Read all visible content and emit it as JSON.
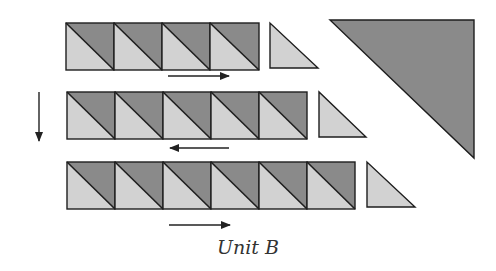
{
  "caption": "Unit B",
  "colors": {
    "dark": "#8a8a8a",
    "light": "#d2d2d2",
    "stroke": "#1e1e1e",
    "arrow": "#222222"
  },
  "rows": [
    {
      "name": "row-1",
      "squares": 4,
      "direction": "right"
    },
    {
      "name": "row-2",
      "squares": 5,
      "direction": "left"
    },
    {
      "name": "row-3",
      "squares": 6,
      "direction": "right"
    }
  ],
  "large_triangle": {
    "fill": "dark"
  },
  "side_arrow": {
    "direction": "down"
  }
}
